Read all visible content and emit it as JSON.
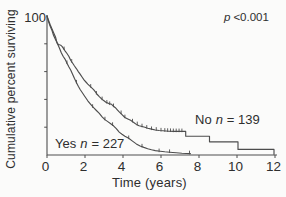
{
  "figure": {
    "background": "#fbfbfa",
    "axis_color": "#4f4f4f",
    "curve_color": "#4d4d4d",
    "text_color": "#2e2e2e"
  },
  "labels": {
    "y_axis": "Cumulative percent surviving",
    "y_top_tick": "100",
    "x_axis": "Time (years)",
    "p_prefix": "p",
    "p_value": "<0.001",
    "no_group": {
      "name": "No",
      "n_symbol": "n",
      "count": "= 139"
    },
    "yes_group": {
      "name": "Yes",
      "n_symbol": "n",
      "count": "= 227"
    }
  },
  "chart_data": {
    "type": "line",
    "subtype": "kaplan-meier-survival",
    "title": "",
    "xlabel": "Time (years)",
    "ylabel": "Cumulative percent surviving",
    "xlim": [
      0,
      12
    ],
    "ylim": [
      0,
      100
    ],
    "x_ticks": [
      0,
      2,
      4,
      6,
      8,
      10,
      12
    ],
    "y_ticks_unlabeled": [
      20,
      40,
      60,
      80
    ],
    "y_tick_labeled": 100,
    "grid": false,
    "legend": "in-plot text",
    "annotation": "p <0.001",
    "series": [
      {
        "name": "No n = 139",
        "group": "No",
        "n": 139,
        "points": [
          [
            0,
            100
          ],
          [
            0.08,
            97
          ],
          [
            0.16,
            94
          ],
          [
            0.25,
            91
          ],
          [
            0.35,
            88
          ],
          [
            0.45,
            85
          ],
          [
            0.5,
            82
          ],
          [
            0.55,
            80
          ],
          [
            0.62,
            79.5
          ],
          [
            0.72,
            79
          ],
          [
            0.8,
            78
          ],
          [
            0.9,
            76
          ],
          [
            0.95,
            75
          ],
          [
            1.05,
            73
          ],
          [
            1.15,
            71
          ],
          [
            1.25,
            68
          ],
          [
            1.35,
            66
          ],
          [
            1.45,
            64
          ],
          [
            1.55,
            62
          ],
          [
            1.65,
            60
          ],
          [
            1.75,
            58
          ],
          [
            1.85,
            56
          ],
          [
            1.95,
            54
          ],
          [
            2.05,
            52.5
          ],
          [
            2.15,
            51
          ],
          [
            2.3,
            49
          ],
          [
            2.45,
            47
          ],
          [
            2.55,
            45.5
          ],
          [
            2.65,
            43.5
          ],
          [
            2.75,
            42
          ],
          [
            2.9,
            40
          ],
          [
            3.0,
            39
          ],
          [
            3.1,
            38
          ],
          [
            3.25,
            37
          ],
          [
            3.4,
            36.5
          ],
          [
            3.5,
            35
          ],
          [
            3.6,
            34
          ],
          [
            3.7,
            32.5
          ],
          [
            3.8,
            31
          ],
          [
            3.95,
            29
          ],
          [
            4.1,
            27
          ],
          [
            4.25,
            26
          ],
          [
            4.4,
            25
          ],
          [
            4.55,
            23.5
          ],
          [
            4.7,
            22
          ],
          [
            4.85,
            21
          ],
          [
            5.0,
            20.5
          ],
          [
            5.15,
            20
          ],
          [
            5.3,
            19.3
          ],
          [
            5.5,
            18.6
          ],
          [
            5.7,
            18
          ],
          [
            5.9,
            17.6
          ],
          [
            6.1,
            17.4
          ],
          [
            6.4,
            17.1
          ],
          [
            6.7,
            17
          ],
          [
            7.3,
            17
          ],
          [
            7.3,
            13.5
          ],
          [
            8.55,
            13.5
          ],
          [
            8.55,
            9.5
          ],
          [
            10.05,
            9.5
          ],
          [
            10.05,
            4
          ],
          [
            11.95,
            4
          ],
          [
            11.95,
            0.5
          ]
        ],
        "censor_marks": [
          [
            0.9,
            76
          ],
          [
            1.3,
            67
          ],
          [
            2.3,
            49
          ],
          [
            2.6,
            44
          ],
          [
            2.9,
            40
          ],
          [
            3.15,
            37.5
          ],
          [
            3.3,
            36.5
          ],
          [
            3.5,
            35
          ],
          [
            3.9,
            30
          ],
          [
            4.1,
            27
          ],
          [
            4.5,
            24
          ],
          [
            4.75,
            22
          ],
          [
            5.0,
            20.5
          ],
          [
            5.25,
            19.5
          ],
          [
            5.5,
            18.5
          ],
          [
            5.75,
            18
          ],
          [
            6.0,
            17.5
          ],
          [
            6.2,
            17.3
          ],
          [
            6.35,
            17.2
          ],
          [
            6.5,
            17.1
          ],
          [
            6.65,
            17
          ],
          [
            6.8,
            17
          ],
          [
            6.95,
            17
          ],
          [
            7.1,
            17
          ]
        ]
      },
      {
        "name": "Yes n = 227",
        "group": "Yes",
        "n": 227,
        "points": [
          [
            0,
            100
          ],
          [
            0.08,
            96
          ],
          [
            0.16,
            93
          ],
          [
            0.25,
            90
          ],
          [
            0.35,
            86
          ],
          [
            0.45,
            83
          ],
          [
            0.55,
            80
          ],
          [
            0.65,
            77
          ],
          [
            0.75,
            73.5
          ],
          [
            0.85,
            71
          ],
          [
            0.95,
            69
          ],
          [
            1.05,
            66
          ],
          [
            1.15,
            63.5
          ],
          [
            1.25,
            61
          ],
          [
            1.35,
            58
          ],
          [
            1.45,
            55
          ],
          [
            1.55,
            52
          ],
          [
            1.65,
            49.5
          ],
          [
            1.75,
            47
          ],
          [
            1.85,
            45
          ],
          [
            1.95,
            43
          ],
          [
            2.05,
            41
          ],
          [
            2.15,
            39
          ],
          [
            2.3,
            36.5
          ],
          [
            2.45,
            34
          ],
          [
            2.6,
            32
          ],
          [
            2.75,
            30
          ],
          [
            2.9,
            27.5
          ],
          [
            3.05,
            25.5
          ],
          [
            3.2,
            24
          ],
          [
            3.35,
            22.5
          ],
          [
            3.5,
            21
          ],
          [
            3.65,
            19
          ],
          [
            3.8,
            16.5
          ],
          [
            3.95,
            15
          ],
          [
            4.1,
            13.5
          ],
          [
            4.3,
            12
          ],
          [
            4.5,
            10
          ],
          [
            4.7,
            8
          ],
          [
            4.9,
            6.5
          ],
          [
            5.1,
            5.5
          ],
          [
            5.3,
            4.5
          ],
          [
            5.5,
            3.8
          ],
          [
            5.7,
            3.2
          ],
          [
            5.95,
            2.7
          ],
          [
            6.2,
            2.3
          ],
          [
            6.45,
            2
          ],
          [
            6.8,
            1.6
          ],
          [
            7.1,
            1.3
          ],
          [
            7.55,
            1
          ]
        ],
        "censor_marks": [
          [
            1.05,
            66
          ],
          [
            1.55,
            52
          ],
          [
            2.4,
            34.5
          ],
          [
            3.05,
            25.5
          ],
          [
            3.45,
            21.5
          ],
          [
            4.3,
            12
          ],
          [
            5.0,
            6
          ],
          [
            5.9,
            2.6
          ],
          [
            6.45,
            2
          ],
          [
            7.5,
            1.1
          ]
        ]
      }
    ]
  },
  "plot_geometry": {
    "x0_px": 47,
    "px_per_year": 19.0,
    "axis_right_px": 277,
    "y100_px": 16,
    "y0_px": 155,
    "axis_top_px": 15,
    "tick_label_baseline_px": 171
  }
}
